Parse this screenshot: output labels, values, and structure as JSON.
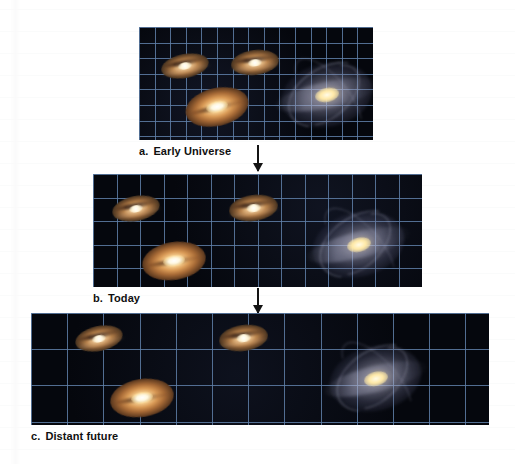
{
  "figure": {
    "background_color": "#ffffff",
    "space_color": "#05070d",
    "grid_color": "#5f7fa8",
    "caption_color": "#101010"
  },
  "panels": [
    {
      "id": "early-universe",
      "label": "a.",
      "caption": "Early Universe",
      "frame": {
        "x": 139,
        "y": 27,
        "width": 234,
        "height": 113
      },
      "grid": {
        "cell_size": 15.6,
        "columns": 15,
        "rows": 7
      },
      "galaxies": [
        {
          "name": "orange-spiral-upper-left",
          "type": "spiral",
          "x": 22,
          "y": 27,
          "width": 48,
          "height": 24,
          "rotation": -11
        },
        {
          "name": "orange-spiral-upper-middle",
          "type": "spiral",
          "x": 92,
          "y": 23,
          "width": 48,
          "height": 25,
          "rotation": -7
        },
        {
          "name": "orange-elliptical-lower-left",
          "type": "elliptical",
          "x": 46,
          "y": 61,
          "width": 64,
          "height": 38,
          "rotation": -13
        },
        {
          "name": "blue-spiral-right",
          "type": "large-spiral",
          "x": 142,
          "y": 36,
          "width": 92,
          "height": 64,
          "rotation": -12
        }
      ]
    },
    {
      "id": "today",
      "label": "b.",
      "caption": "Today",
      "frame": {
        "x": 93,
        "y": 174,
        "width": 329,
        "height": 113
      },
      "grid": {
        "cell_size": 23.5,
        "columns": 14,
        "rows": 5
      },
      "galaxies": [
        {
          "name": "orange-spiral-upper-left",
          "type": "spiral",
          "x": 19,
          "y": 22,
          "width": 48,
          "height": 25,
          "rotation": -11
        },
        {
          "name": "orange-spiral-upper-middle",
          "type": "spiral",
          "x": 136,
          "y": 21,
          "width": 49,
          "height": 26,
          "rotation": -8
        },
        {
          "name": "orange-elliptical-lower-left",
          "type": "elliptical",
          "x": 49,
          "y": 68,
          "width": 64,
          "height": 38,
          "rotation": -9
        },
        {
          "name": "blue-spiral-right",
          "type": "large-spiral",
          "x": 219,
          "y": 38,
          "width": 93,
          "height": 65,
          "rotation": -14
        }
      ]
    },
    {
      "id": "distant-future",
      "label": "c.",
      "caption": "Distant future",
      "frame": {
        "x": 31,
        "y": 313,
        "width": 458,
        "height": 112
      },
      "grid": {
        "cell_size": 36.2,
        "columns": 13,
        "rows": 4
      },
      "galaxies": [
        {
          "name": "orange-spiral-upper-left",
          "type": "spiral",
          "x": 44,
          "y": 13,
          "width": 48,
          "height": 25,
          "rotation": -12
        },
        {
          "name": "orange-spiral-upper-middle",
          "type": "spiral",
          "x": 188,
          "y": 12,
          "width": 49,
          "height": 26,
          "rotation": -8
        },
        {
          "name": "orange-elliptical-lower-left",
          "type": "elliptical",
          "x": 79,
          "y": 66,
          "width": 64,
          "height": 38,
          "rotation": -9
        },
        {
          "name": "blue-spiral-right",
          "type": "large-spiral",
          "x": 298,
          "y": 33,
          "width": 93,
          "height": 65,
          "rotation": -14
        }
      ]
    }
  ],
  "arrows": [
    {
      "name": "arrow-early-to-today",
      "direction": "down",
      "x": 258,
      "y": 145,
      "length": 26
    },
    {
      "name": "arrow-today-to-future",
      "direction": "down",
      "x": 258,
      "y": 288,
      "length": 25
    }
  ]
}
